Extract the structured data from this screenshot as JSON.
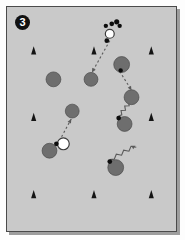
{
  "figure": {
    "panel_label": "3",
    "background_color": "#c9c9c9",
    "border_color": "#4a4a4a",
    "page_color": "#fdfdfd",
    "shadow_color": "#9d9d9d"
  },
  "legend_colors": {
    "robot_fill": "#6e6e6e",
    "robot_stroke": "#4a4a4a",
    "target_fill": "#ffffff",
    "target_stroke": "#3a3a3a",
    "marker_fill": "#141414",
    "dot_fill": "#0d0d0d",
    "path_stroke": "#5a5a5a"
  },
  "chart_data": {
    "type": "scatter",
    "title": "3",
    "xlabel": "",
    "ylabel": "",
    "xlim": [
      0,
      171
    ],
    "ylim": [
      0,
      226
    ],
    "grid": false,
    "legend": "none",
    "series": [
      {
        "name": "robots",
        "marker": "filled-circle",
        "color": "#6e6e6e",
        "points": [
          {
            "x": 47,
            "y": 73,
            "r": 7.5
          },
          {
            "x": 85,
            "y": 73,
            "r": 7.0
          },
          {
            "x": 116,
            "y": 58,
            "r": 8.0
          },
          {
            "x": 126,
            "y": 91,
            "r": 7.5
          },
          {
            "x": 66,
            "y": 105,
            "r": 7.0
          },
          {
            "x": 43,
            "y": 145,
            "r": 7.5
          },
          {
            "x": 119,
            "y": 118,
            "r": 7.5
          },
          {
            "x": 110,
            "y": 162,
            "r": 8.0
          }
        ]
      },
      {
        "name": "targets",
        "marker": "open-circle",
        "color": "#ffffff",
        "points": [
          {
            "x": 57,
            "y": 138,
            "r": 6.0
          },
          {
            "x": 104,
            "y": 27,
            "r": 4.5
          }
        ]
      },
      {
        "name": "sensor-dots",
        "marker": "small-dot",
        "color": "#0d0d0d",
        "points": [
          {
            "x": 115,
            "y": 64,
            "r": 2.2
          },
          {
            "x": 113,
            "y": 112,
            "r": 2.4
          },
          {
            "x": 104,
            "y": 156,
            "r": 2.4
          },
          {
            "x": 50,
            "y": 138,
            "r": 2.4
          },
          {
            "x": 100,
            "y": 19,
            "r": 2.2
          },
          {
            "x": 106,
            "y": 17,
            "r": 2.4
          },
          {
            "x": 111,
            "y": 15,
            "r": 2.6
          },
          {
            "x": 114,
            "y": 19,
            "r": 2.2
          },
          {
            "x": 101,
            "y": 34,
            "r": 2.4
          }
        ]
      },
      {
        "name": "landmarks",
        "marker": "triangle",
        "color": "#141414",
        "points": [
          {
            "x": 27,
            "y": 45
          },
          {
            "x": 88,
            "y": 45
          },
          {
            "x": 146,
            "y": 45
          },
          {
            "x": 27,
            "y": 112
          },
          {
            "x": 146,
            "y": 112
          },
          {
            "x": 27,
            "y": 190
          },
          {
            "x": 88,
            "y": 190
          },
          {
            "x": 146,
            "y": 190
          }
        ]
      }
    ],
    "annotations": [
      {
        "type": "dashed-arrow",
        "name": "path-top-center",
        "from": {
          "x": 104,
          "y": 34
        },
        "to": {
          "x": 86,
          "y": 66
        }
      },
      {
        "type": "dashed-arrow",
        "name": "path-right",
        "from": {
          "x": 114,
          "y": 65
        },
        "to": {
          "x": 126,
          "y": 84
        }
      },
      {
        "type": "dashed-arrow",
        "name": "path-lower-left",
        "from": {
          "x": 53,
          "y": 135
        },
        "to": {
          "x": 65,
          "y": 113
        }
      },
      {
        "type": "squiggle",
        "name": "squiggle-center-right",
        "from": {
          "x": 113,
          "y": 110
        },
        "to": {
          "x": 126,
          "y": 94
        }
      },
      {
        "type": "squiggle",
        "name": "squiggle-bottom-right",
        "from": {
          "x": 104,
          "y": 154
        },
        "to": {
          "x": 130,
          "y": 140
        }
      }
    ]
  }
}
